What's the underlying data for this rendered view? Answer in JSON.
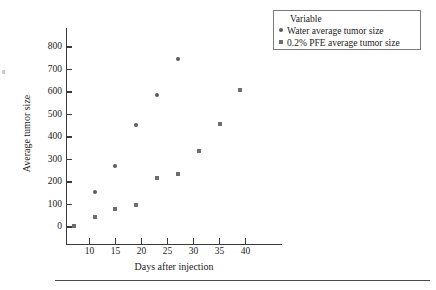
{
  "chart_data": {
    "type": "scatter",
    "title": "",
    "xlabel": "Days after injection",
    "ylabel": "Average tumor size",
    "xlim": [
      5.5,
      47
    ],
    "ylim": [
      -60,
      860
    ],
    "xticks": [
      10,
      15,
      20,
      25,
      30,
      35,
      40
    ],
    "yticks": [
      0,
      100,
      200,
      300,
      400,
      500,
      600,
      700,
      800
    ],
    "grid": false,
    "legend_position": "top-right",
    "legend_title": "Variable",
    "series": [
      {
        "name": "Water average tumor size",
        "marker": "circle",
        "color": "#5c5c5c",
        "points": [
          {
            "x": 11,
            "y": 155
          },
          {
            "x": 15,
            "y": 273
          },
          {
            "x": 19,
            "y": 453
          },
          {
            "x": 23,
            "y": 585
          },
          {
            "x": 27,
            "y": 745
          }
        ]
      },
      {
        "name": "0.2% PFE average tumor size",
        "marker": "square",
        "color": "#6e6e6e",
        "points": [
          {
            "x": 7,
            "y": 3
          },
          {
            "x": 11,
            "y": 43
          },
          {
            "x": 15,
            "y": 80
          },
          {
            "x": 19,
            "y": 96
          },
          {
            "x": 23,
            "y": 217
          },
          {
            "x": 27,
            "y": 237
          },
          {
            "x": 31,
            "y": 339
          },
          {
            "x": 35,
            "y": 457
          },
          {
            "x": 39,
            "y": 607
          }
        ]
      }
    ]
  },
  "axes": {
    "x_title": "Days after injection",
    "y_title": "Average tumor size",
    "x_tick_labels": [
      "10",
      "15",
      "20",
      "25",
      "30",
      "35",
      "40"
    ],
    "y_tick_labels": [
      "0",
      "100",
      "200",
      "300",
      "400",
      "500",
      "600",
      "700",
      "800"
    ]
  },
  "legend": {
    "title": "Variable",
    "entries": [
      {
        "label": "Water average tumor size",
        "marker": "circle-marker"
      },
      {
        "label": "0.2% PFE average tumor size",
        "marker": "square-marker"
      }
    ]
  }
}
